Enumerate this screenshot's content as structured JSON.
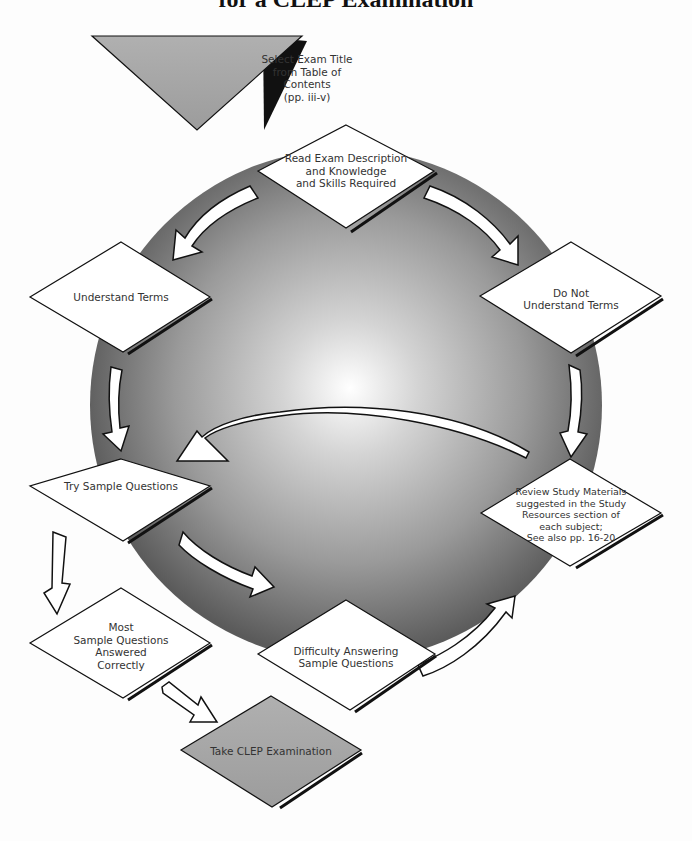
{
  "title": "for a CLEP Examination",
  "colors": {
    "sphere_edge": "#5e5e5e",
    "sphere_highlight": "#ffffff",
    "gray_node": "#a6a6a6",
    "white_node": "#ffffff",
    "outline": "#1a1a1a"
  },
  "nodes": {
    "start": {
      "label": "Select Exam Title from Table of Contents (pp. iii-v)",
      "lines": [
        "Select Exam Title",
        "from Table of",
        "Contents",
        "(pp. iii-v)"
      ]
    },
    "read": {
      "label": "Read Exam Description and Knowledge and Skills Required"
    },
    "understand": {
      "label": "Understand Terms"
    },
    "not_understand": {
      "label": "Do Not Understand Terms"
    },
    "try": {
      "label": "Try Sample Questions"
    },
    "review": {
      "label": "Review Study Materials suggested in the Study Resources section of each subject; See also pp. 16-20"
    },
    "most": {
      "label": "Most Sample Questions Answered Correctly"
    },
    "difficulty": {
      "label": "Difficulty Answering Sample Questions"
    },
    "take": {
      "label": "Take CLEP Examination"
    }
  },
  "text": {
    "start_l1": "Select Exam Title",
    "start_l2": "from Table of",
    "start_l3": "Contents",
    "start_l4": "(pp. iii-v)",
    "read_l1": "Read Exam Description",
    "read_l2": "and Knowledge",
    "read_l3": "and Skills Required",
    "understand_l1": "Understand Terms",
    "not_l1": "Do Not",
    "not_l2": "Understand Terms",
    "try_l1": "Try Sample Questions",
    "review_l1": "Review Study Materials",
    "review_l2": "suggested in the Study",
    "review_l3": "Resources section of",
    "review_l4": "each subject;",
    "review_l5": "See also pp. 16-20",
    "most_l1": "Most",
    "most_l2": "Sample Questions",
    "most_l3": "Answered",
    "most_l4": "Correctly",
    "diff_l1": "Difficulty Answering",
    "diff_l2": "Sample Questions",
    "take_l1": "Take CLEP Examination"
  },
  "edges": [
    {
      "from": "start",
      "to": "read"
    },
    {
      "from": "read",
      "to": "understand"
    },
    {
      "from": "read",
      "to": "not_understand"
    },
    {
      "from": "understand",
      "to": "try"
    },
    {
      "from": "not_understand",
      "to": "review"
    },
    {
      "from": "review",
      "to": "try"
    },
    {
      "from": "try",
      "to": "most"
    },
    {
      "from": "try",
      "to": "difficulty"
    },
    {
      "from": "difficulty",
      "to": "review"
    },
    {
      "from": "most",
      "to": "take"
    }
  ]
}
